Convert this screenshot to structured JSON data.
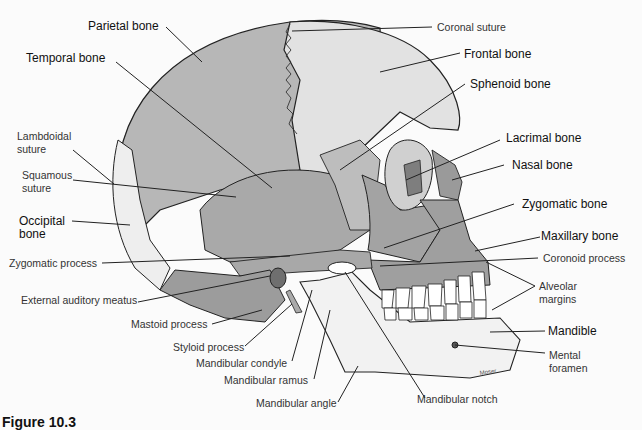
{
  "figure": {
    "caption": "Figure 10.3",
    "signature": "Moser",
    "colors": {
      "background": "#fbfbfb",
      "parietal": "#b7b7b7",
      "frontal": "#e2e2e2",
      "temporal": "#a9a9a9",
      "facial": "#9f9f9f",
      "mandible": "#f2f2f2",
      "teeth": "#ffffff",
      "line": "#222222"
    }
  },
  "labels": {
    "parietal_bone": "Parietal bone",
    "temporal_bone": "Temporal bone",
    "lambdoidal_suture_1": "Lambdoidal",
    "lambdoidal_suture_2": "suture",
    "squamous_suture_1": "Squamous",
    "squamous_suture_2": "suture",
    "occipital_bone_1": "Occipital",
    "occipital_bone_2": "bone",
    "zygomatic_process": "Zygomatic process",
    "external_auditory_meatus": "External auditory meatus",
    "mastoid_process": "Mastoid process",
    "styloid_process": "Styloid process",
    "mandibular_condyle": "Mandibular condyle",
    "mandibular_ramus": "Mandibular ramus",
    "mandibular_angle": "Mandibular angle",
    "coronal_suture": "Coronal suture",
    "frontal_bone": "Frontal bone",
    "sphenoid_bone": "Sphenoid bone",
    "lacrimal_bone": "Lacrimal bone",
    "nasal_bone": "Nasal bone",
    "zygomatic_bone": "Zygomatic bone",
    "maxillary_bone": "Maxillary bone",
    "coronoid_process": "Coronoid process",
    "alveolar_margins_1": "Alveolar",
    "alveolar_margins_2": "margins",
    "mandible": "Mandible",
    "mental_foramen_1": "Mental",
    "mental_foramen_2": "foramen",
    "mandibular_notch": "Mandibular notch"
  }
}
